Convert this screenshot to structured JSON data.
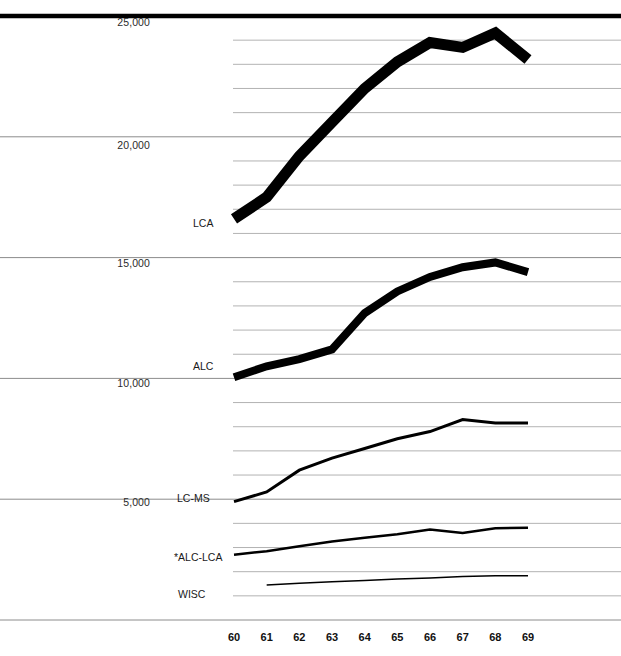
{
  "chart_data": {
    "type": "line",
    "title": "",
    "subtitle": "",
    "xlabel": "",
    "ylabel": "",
    "x": [
      60,
      61,
      62,
      63,
      64,
      65,
      66,
      67,
      68,
      69
    ],
    "categories": [
      "60",
      "61",
      "62",
      "63",
      "64",
      "65",
      "66",
      "67",
      "68",
      "69"
    ],
    "xlim": [
      60,
      69
    ],
    "ylim": [
      0,
      25000
    ],
    "grid": true,
    "grid_major_step": 5000,
    "grid_minor_step": 1000,
    "legend_position": "inline-left-of-series",
    "y_tick_labels": [
      "25,000",
      "20,000",
      "15,000",
      "10,000",
      "5,000"
    ],
    "y_tick_values": [
      25000,
      20000,
      15000,
      10000,
      5000
    ],
    "x_tick_labels": [
      "60",
      "61",
      "62",
      "63",
      "64",
      "65",
      "66",
      "67",
      "68",
      "69"
    ],
    "series": [
      {
        "name": "LCA",
        "label": "LCA",
        "color": "#000000",
        "line_width": 11,
        "x": [
          60,
          61,
          62,
          63,
          64,
          65,
          66,
          67,
          68,
          69
        ],
        "values": [
          16600,
          17500,
          19200,
          20600,
          22000,
          23100,
          23900,
          23700,
          24300,
          23200
        ]
      },
      {
        "name": "ALC",
        "label": "ALC",
        "color": "#000000",
        "line_width": 8,
        "x": [
          60,
          61,
          62,
          63,
          64,
          65,
          66,
          67,
          68,
          69
        ],
        "values": [
          10050,
          10500,
          10800,
          11200,
          12700,
          13600,
          14200,
          14600,
          14800,
          14400
        ]
      },
      {
        "name": "LC-MS",
        "label": "LC-MS",
        "color": "#000000",
        "line_width": 3,
        "x": [
          60,
          61,
          62,
          63,
          64,
          65,
          66,
          67,
          68,
          69
        ],
        "values": [
          4900,
          5300,
          6200,
          6700,
          7100,
          7500,
          7800,
          8300,
          8150,
          8150
        ]
      },
      {
        "name": "*ALC-LCA",
        "label": "*ALC-LCA",
        "color": "#000000",
        "line_width": 2.5,
        "x": [
          60,
          61,
          62,
          63,
          64,
          65,
          66,
          67,
          68,
          69
        ],
        "values": [
          2700,
          2850,
          3050,
          3250,
          3400,
          3550,
          3750,
          3600,
          3800,
          3820
        ]
      },
      {
        "name": "WISC",
        "label": "WISC",
        "color": "#000000",
        "line_width": 1.5,
        "x": [
          61,
          62,
          63,
          64,
          65,
          66,
          67,
          68,
          69
        ],
        "values": [
          1450,
          1520,
          1580,
          1640,
          1700,
          1740,
          1800,
          1830,
          1830
        ]
      }
    ],
    "series_label_positions": [
      {
        "name": "LCA",
        "x": 193,
        "y": 223
      },
      {
        "name": "ALC",
        "x": 193,
        "y": 366
      },
      {
        "name": "LC-MS",
        "x": 177,
        "y": 498
      },
      {
        "name": "*ALC-LCA",
        "x": 174,
        "y": 557
      },
      {
        "name": "WISC",
        "x": 178,
        "y": 594
      }
    ],
    "y_label_positions": [
      {
        "label": "25,000",
        "y": 22
      },
      {
        "label": "20,000",
        "y": 145
      },
      {
        "label": "15,000",
        "y": 263
      },
      {
        "label": "10,000",
        "y": 383
      },
      {
        "label": "5,000",
        "y": 502
      }
    ],
    "colors": {
      "line": "#000000",
      "grid_major": "#8c8c8c",
      "grid_minor": "#aaaaaa",
      "top_rule": "#000000",
      "text": "#1a1a1a",
      "background": "#ffffff"
    }
  }
}
